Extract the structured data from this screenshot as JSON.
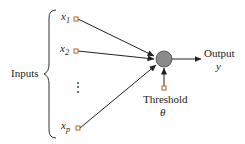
{
  "diagram": {
    "inputs_label": "Inputs",
    "inputs": [
      {
        "var": "x",
        "sub": "1"
      },
      {
        "var": "x",
        "sub": "2"
      },
      {
        "var": "x",
        "sub": "p"
      }
    ],
    "ellipsis": "⋮",
    "output_label": "Output",
    "output_var": "y",
    "threshold_label": "Threshold",
    "threshold_var": "θ",
    "colors": {
      "node_fill": "#8a8a8a",
      "terminal_square": "#b5651d",
      "line": "#222222"
    }
  }
}
